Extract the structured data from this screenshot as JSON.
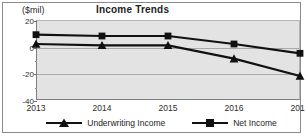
{
  "chart_data": {
    "type": "line",
    "title": "Income Trends",
    "xlabel": "",
    "ylabel": "($mil)",
    "unit_label": "($mil)",
    "categories": [
      "2013",
      "2014",
      "2015",
      "2016",
      "2017"
    ],
    "x": [
      2013,
      2014,
      2015,
      2016,
      2017
    ],
    "ylim": [
      -40,
      20
    ],
    "yticks": [
      20,
      0,
      -20,
      -40
    ],
    "ytick_labels": [
      "20",
      "0",
      "-20",
      "-40"
    ],
    "grid": true,
    "legend_position": "bottom",
    "series": [
      {
        "name": "Underwriting Income",
        "marker": "triangle",
        "color": "#111111",
        "values": [
          2,
          1,
          1,
          -9,
          -22
        ]
      },
      {
        "name": "Net Income",
        "marker": "square",
        "color": "#111111",
        "values": [
          9,
          8,
          8,
          2,
          -5
        ]
      }
    ]
  },
  "legend": {
    "entries": [
      {
        "label": "Underwriting Income",
        "marker": "triangle-marker"
      },
      {
        "label": "Net Income",
        "marker": "square-marker"
      }
    ]
  },
  "colors": {
    "plot_background": "#e3e3e3",
    "figure_background": "#ffffff",
    "gridline": "#a9a9a9",
    "series_line": "#111111",
    "frame_border": "#8a8a8a",
    "text": "#2b2b2b"
  }
}
